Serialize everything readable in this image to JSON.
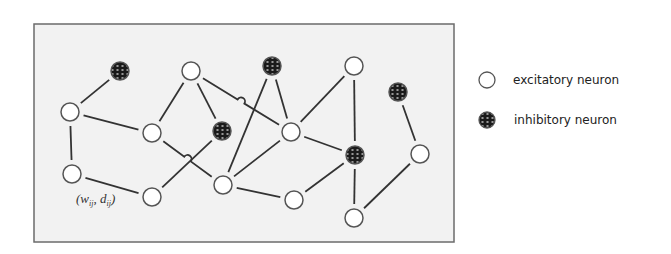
{
  "diagram": {
    "box": {
      "x": 34,
      "y": 24,
      "width": 420,
      "height": 218,
      "fill": "#f2f2f2",
      "stroke": "#6b6b6b"
    },
    "node_radius": 9,
    "colors": {
      "excitatory_fill": "#ffffff",
      "node_stroke": "#555555",
      "inhibitory_fill": "#1a1a1a",
      "edge": "#333333"
    },
    "nodes": [
      {
        "id": "n1",
        "type": "inhibitory",
        "x": 120,
        "y": 71
      },
      {
        "id": "n2",
        "type": "excitatory",
        "x": 70,
        "y": 112
      },
      {
        "id": "n3",
        "type": "excitatory",
        "x": 72,
        "y": 174
      },
      {
        "id": "n4",
        "type": "excitatory",
        "x": 152,
        "y": 133
      },
      {
        "id": "n5",
        "type": "excitatory",
        "x": 152,
        "y": 197
      },
      {
        "id": "n6",
        "type": "excitatory",
        "x": 191,
        "y": 71
      },
      {
        "id": "n7",
        "type": "inhibitory",
        "x": 222,
        "y": 131
      },
      {
        "id": "n8",
        "type": "inhibitory",
        "x": 272,
        "y": 66
      },
      {
        "id": "n9",
        "type": "excitatory",
        "x": 291,
        "y": 132
      },
      {
        "id": "n10",
        "type": "excitatory",
        "x": 223,
        "y": 185
      },
      {
        "id": "n11",
        "type": "excitatory",
        "x": 294,
        "y": 200
      },
      {
        "id": "n12",
        "type": "excitatory",
        "x": 354,
        "y": 66
      },
      {
        "id": "n13",
        "type": "inhibitory",
        "x": 355,
        "y": 155
      },
      {
        "id": "n14",
        "type": "inhibitory",
        "x": 398,
        "y": 92
      },
      {
        "id": "n15",
        "type": "excitatory",
        "x": 420,
        "y": 154
      },
      {
        "id": "n16",
        "type": "excitatory",
        "x": 354,
        "y": 218
      }
    ],
    "edges": [
      {
        "from": "n1",
        "to": "n2"
      },
      {
        "from": "n2",
        "to": "n3"
      },
      {
        "from": "n2",
        "to": "n4"
      },
      {
        "from": "n3",
        "to": "n5"
      },
      {
        "from": "n6",
        "to": "n4"
      },
      {
        "from": "n6",
        "to": "n7"
      },
      {
        "from": "n6",
        "to": "n9",
        "hop": true
      },
      {
        "from": "n4",
        "to": "n10",
        "hop": true
      },
      {
        "from": "n5",
        "to": "n7"
      },
      {
        "from": "n8",
        "to": "n10"
      },
      {
        "from": "n8",
        "to": "n9"
      },
      {
        "from": "n9",
        "to": "n10"
      },
      {
        "from": "n9",
        "to": "n13"
      },
      {
        "from": "n10",
        "to": "n11"
      },
      {
        "from": "n12",
        "to": "n9"
      },
      {
        "from": "n12",
        "to": "n13"
      },
      {
        "from": "n13",
        "to": "n11"
      },
      {
        "from": "n13",
        "to": "n16"
      },
      {
        "from": "n14",
        "to": "n15"
      },
      {
        "from": "n15",
        "to": "n16"
      }
    ],
    "edge_label": {
      "text_w": "(w",
      "sub_w": "ij",
      "text_d": ", d",
      "sub_d": "ij",
      "close": ")",
      "x": 76,
      "y": 203
    }
  },
  "legend": {
    "items": [
      {
        "type": "excitatory",
        "label": "excitatory neuron",
        "x": 487,
        "y": 80
      },
      {
        "type": "inhibitory",
        "label": "inhibitory neuron",
        "x": 487,
        "y": 120
      }
    ]
  }
}
